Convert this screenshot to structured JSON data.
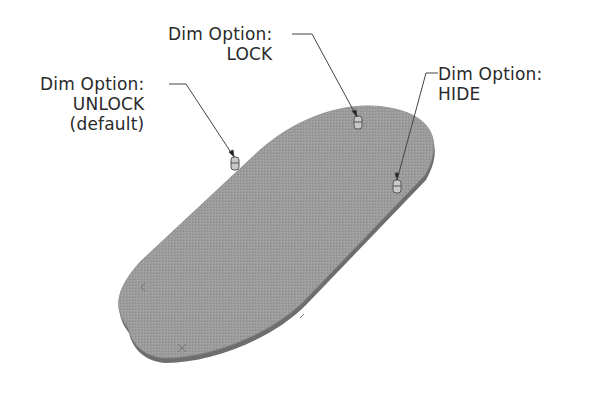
{
  "figure": {
    "callouts": [
      {
        "id": "lock",
        "lines": [
          "Dim Option:",
          "LOCK"
        ]
      },
      {
        "id": "unlock",
        "lines": [
          "Dim Option:",
          "UNLOCK",
          "(default)"
        ]
      },
      {
        "id": "hide",
        "lines": [
          "Dim Option:",
          "HIDE"
        ]
      }
    ]
  },
  "colors": {
    "plate_face": "#9a9a9a",
    "plate_edge": "#6e6e6e",
    "leader": "#444444",
    "text": "#2a2a2a"
  }
}
